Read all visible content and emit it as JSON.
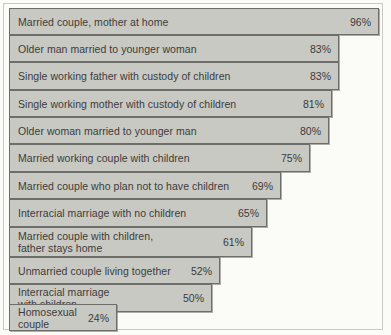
{
  "chart_data": {
    "type": "bar",
    "orientation": "horizontal",
    "title": "",
    "subtitle": "",
    "xlabel": "",
    "ylabel": "",
    "xlim": [
      0,
      100
    ],
    "grid": false,
    "legend": null,
    "value_suffix": "%",
    "categories": [
      "Married couple, mother at home",
      "Older man married to younger woman",
      "Single working father with custody of children",
      "Single working mother with custody of children",
      "Older woman married to younger man",
      "Married working couple with children",
      "Married couple who plan not to have children",
      "Interracial marriage with no children",
      "Married couple with children,\nfather stays home",
      "Unmarried couple living together",
      "Interracial marriage\nwith children",
      "Homosexual\ncouple"
    ],
    "values": [
      96,
      83,
      83,
      81,
      80,
      75,
      69,
      65,
      61,
      52,
      50,
      24
    ],
    "value_labels": [
      "96%",
      "83%",
      "83%",
      "81%",
      "80%",
      "75%",
      "69%",
      "65%",
      "61%",
      "52%",
      "50%",
      "24%"
    ]
  },
  "style": {
    "bar_fill": "#c9c9c3",
    "bar_border": "#6d6d69",
    "text_color": "#3b3b3b",
    "background": "#fbfbf8",
    "frame_color": "#c9c9c2"
  },
  "bars": [
    {
      "label": "Married couple, mother at home",
      "value_label": "96%",
      "top": 8,
      "height": 27,
      "width": 370
    },
    {
      "label": "Older man married to younger woman",
      "value_label": "83%",
      "top": 35,
      "height": 27,
      "width": 330
    },
    {
      "label": "Single working father with custody of children",
      "value_label": "83%",
      "top": 62,
      "height": 28,
      "width": 330
    },
    {
      "label": "Single working mother with custody of children",
      "value_label": "81%",
      "top": 90,
      "height": 27,
      "width": 323
    },
    {
      "label": "Older woman married to younger man",
      "value_label": "80%",
      "top": 117,
      "height": 27,
      "width": 320
    },
    {
      "label": "Married working couple with children",
      "value_label": "75%",
      "top": 144,
      "height": 28,
      "width": 301
    },
    {
      "label": "Married couple who plan not to have children",
      "value_label": "69%",
      "top": 172,
      "height": 27,
      "width": 272
    },
    {
      "label": "Interracial marriage with no children",
      "value_label": "65%",
      "top": 199,
      "height": 28,
      "width": 258
    },
    {
      "label": "Married couple with children,\nfather stays home",
      "value_label": "61%",
      "top": 227,
      "height": 30,
      "width": 243
    },
    {
      "label": "Unmarried couple living together",
      "value_label": "52%",
      "top": 257,
      "height": 27,
      "width": 211
    },
    {
      "label": "Interracial marriage\nwith children",
      "value_label": "50%",
      "top": 284,
      "height": 28,
      "width": 203
    },
    {
      "label": "Homosexual\ncouple",
      "value_label": "24%",
      "top": 304,
      "height": 27,
      "width": 108
    }
  ]
}
